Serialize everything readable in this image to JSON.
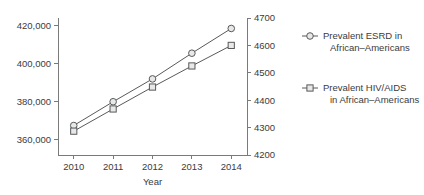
{
  "chart_data": {
    "type": "line",
    "title": "",
    "xlabel": "Year",
    "ylabel": "",
    "x": [
      2010,
      2011,
      2012,
      2013,
      2014
    ],
    "xticklabels": [
      "2010",
      "2011",
      "2012",
      "2013",
      "2014"
    ],
    "xlim": [
      2009.6,
      2014.4
    ],
    "grid": false,
    "legend_position": "right",
    "axes": {
      "left": {
        "ticks": [
          360000,
          380000,
          400000,
          420000
        ],
        "ticklabels": [
          "360,000",
          "380,000",
          "400,000",
          "420,000"
        ],
        "lim": [
          352000,
          424000
        ]
      },
      "right": {
        "ticks": [
          4200,
          4300,
          4400,
          4500,
          4600,
          4700
        ],
        "ticklabels": [
          "4200",
          "4300",
          "4400",
          "4500",
          "4600",
          "4700"
        ],
        "lim": [
          4200,
          4700
        ]
      }
    },
    "series": [
      {
        "name": "Prevalent ESRD in African–Americans",
        "legend_line1": "Prevalent ESRD in",
        "legend_line2": "African–Americans",
        "marker": "circle",
        "axis": "left",
        "values": [
          367500,
          380000,
          392000,
          405500,
          418500
        ]
      },
      {
        "name": "Prevalent HIV/AIDS in African–Americans",
        "legend_line1": "Prevalent HIV/AIDS",
        "legend_line2": "in African–Americans",
        "marker": "square",
        "axis": "right",
        "values": [
          4287,
          4368,
          4448,
          4525,
          4600
        ]
      }
    ],
    "colors": {
      "line": "#58595b",
      "marker_fill": "#e8e8e8",
      "axis": "#7a7a7a",
      "text": "#3b3b3b"
    }
  }
}
